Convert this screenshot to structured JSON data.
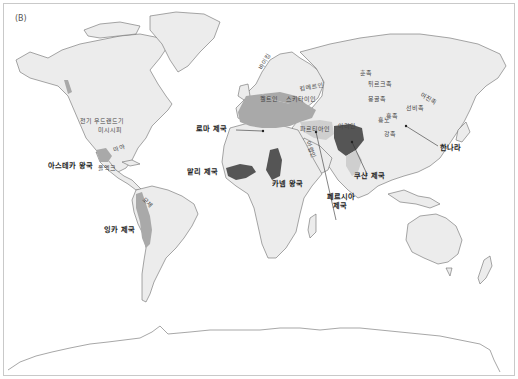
{
  "figure": {
    "panel_label": "(B)",
    "colors": {
      "land": "#ececec",
      "coast": "#6b6b6b",
      "empire_dark": "#555555",
      "region_mid": "#a9a9a9",
      "region_light": "#cfcfcf",
      "background": "#ffffff"
    }
  },
  "labels": {
    "americas": {
      "early_woodland": "전기 우드랜드기",
      "mississippi": "미시시피",
      "maya": "마야",
      "olmec": "올멕크",
      "aztec": "아스테카 왕국",
      "moche": "모체",
      "inca": "잉카 제국"
    },
    "europe_africa": {
      "viking": "바이킹",
      "celts": "켈트인",
      "scythians": "스키타이인",
      "cimmerians": "킴메르인",
      "roman_empire": "로마 제국",
      "mali_empire": "말리 제국",
      "kanem_kingdom": "카넴 왕국",
      "parthians": "파르티아인",
      "arabs": "아랍인",
      "persian_empire_l1": "페르시아",
      "persian_empire_l2": "제국"
    },
    "asia": {
      "huns": "훈족",
      "turks": "튀르크족",
      "mongols": "몽골족",
      "aryans": "아리안",
      "huns_xiongnu": "흉노",
      "xiongnu": "흉족",
      "qiang": "강족",
      "xianbei": "선비족",
      "jurchen": "여진족",
      "kushan_empire": "쿠샨 제국",
      "han_dynasty": "한나라"
    }
  }
}
